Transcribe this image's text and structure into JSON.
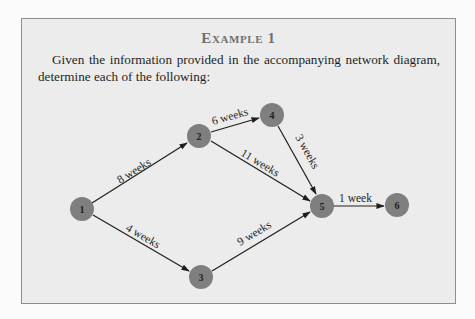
{
  "example": {
    "title": "Example 1",
    "intro_text": "Given the information provided in the accompanying network diagram, determine each of the following:"
  },
  "diagram": {
    "node_color": "#7f7f7f",
    "edge_color": "#1e1e1e",
    "nodes": [
      {
        "id": "1",
        "label": "1"
      },
      {
        "id": "2",
        "label": "2"
      },
      {
        "id": "3",
        "label": "3"
      },
      {
        "id": "4",
        "label": "4"
      },
      {
        "id": "5",
        "label": "5"
      },
      {
        "id": "6",
        "label": "6"
      }
    ],
    "edges": [
      {
        "from": "1",
        "to": "2",
        "label": "8 weeks"
      },
      {
        "from": "1",
        "to": "3",
        "label": "4 weeks"
      },
      {
        "from": "2",
        "to": "4",
        "label": "6 weeks"
      },
      {
        "from": "2",
        "to": "5",
        "label": "11 weeks"
      },
      {
        "from": "4",
        "to": "5",
        "label": "3 weeks"
      },
      {
        "from": "3",
        "to": "5",
        "label": "9 weeks"
      },
      {
        "from": "5",
        "to": "6",
        "label": "1 week"
      }
    ]
  }
}
